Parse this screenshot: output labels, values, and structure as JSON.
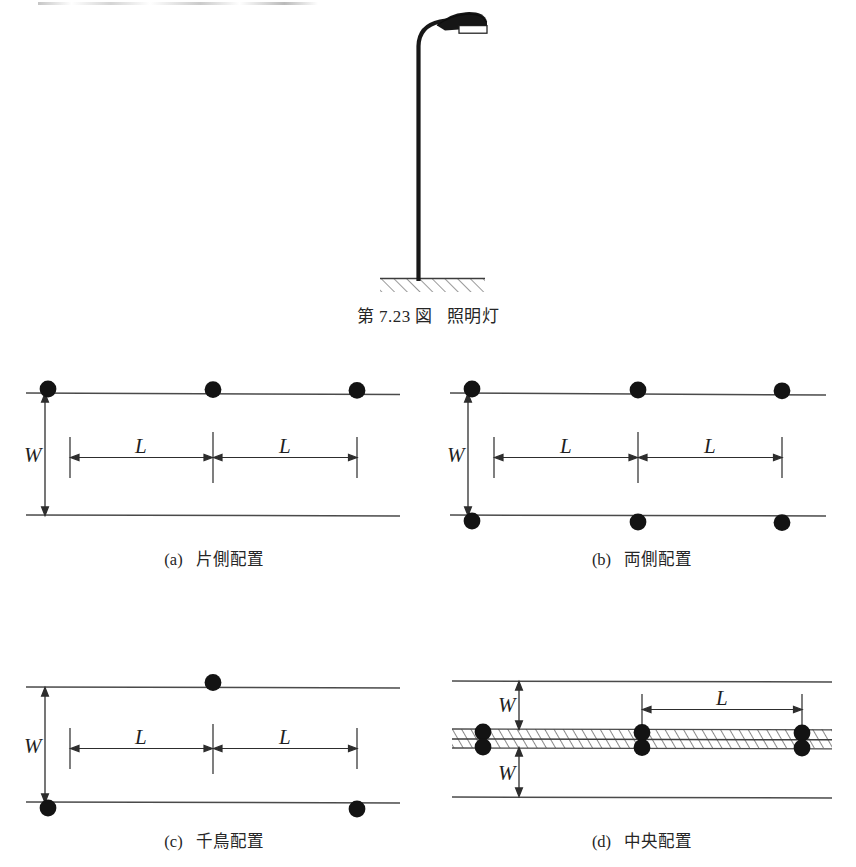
{
  "figure": {
    "caption_number": "第 7.23 図",
    "caption_title": "照明灯",
    "lamp": {
      "pole_label": "lamp-pole",
      "head_label": "lamp-head",
      "ground_label": "ground-hatch"
    }
  },
  "panels": [
    {
      "id": "a",
      "index_label": "(a)",
      "caption": "片側配置",
      "caption_romaji": "one-side arrangement",
      "width_label": "W",
      "spacing_labels": [
        "L",
        "L"
      ],
      "lamps_top": 3,
      "lamps_bottom": 0,
      "has_median": false
    },
    {
      "id": "b",
      "index_label": "(b)",
      "caption": "両側配置",
      "caption_romaji": "both-sides arrangement",
      "width_label": "W",
      "spacing_labels": [
        "L",
        "L"
      ],
      "lamps_top": 3,
      "lamps_bottom": 3,
      "has_median": false
    },
    {
      "id": "c",
      "index_label": "(c)",
      "caption": "千鳥配置",
      "caption_romaji": "staggered arrangement",
      "width_label": "W",
      "spacing_labels": [
        "L",
        "L"
      ],
      "lamps_top": 1,
      "lamps_bottom": 2,
      "has_median": false
    },
    {
      "id": "d",
      "index_label": "(d)",
      "caption": "中央配置",
      "caption_romaji": "central arrangement",
      "width_label_upper": "W",
      "width_label_lower": "W",
      "spacing_labels": [
        "L"
      ],
      "lamp_pairs": 3,
      "has_median": true
    }
  ],
  "colors": {
    "ink": "#1a1a1a",
    "line": "#4a4a4a",
    "lamp_fill": "#141414",
    "hatch": "#6b6b6b",
    "background": "#ffffff"
  }
}
